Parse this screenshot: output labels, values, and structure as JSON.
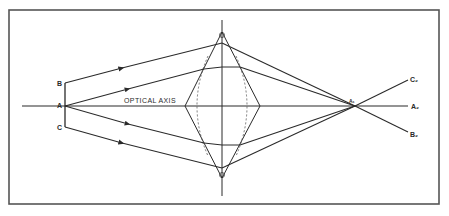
{
  "figure": {
    "type": "optical ray diagram",
    "frame_color": "#555555",
    "line_color": "#2a2a2a",
    "axis_label": "OPTICAL AXIS",
    "object_points": {
      "B": "B",
      "A": "A",
      "C": "C"
    },
    "focus_label": "A₁",
    "image_labels": {
      "C2": "C₂",
      "A2": "A₂",
      "B2": "B₂"
    },
    "lens": {
      "shape": "biconvex (drawn as rhombus with dashed arcs)",
      "vertices": [
        "top",
        "bottom",
        "left",
        "right"
      ]
    },
    "rays": [
      {
        "from": "B",
        "to": "A₁",
        "continues_to": "B₂",
        "arrow": true
      },
      {
        "from": "A",
        "to": "A₁",
        "direction": "upper",
        "arrow": true
      },
      {
        "from": "A",
        "to": "A₁",
        "direction": "lower",
        "arrow": true
      },
      {
        "from": "C",
        "to": "A₁",
        "continues_to": "C₂",
        "arrow": true
      }
    ]
  }
}
